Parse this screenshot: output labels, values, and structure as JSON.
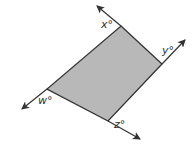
{
  "diagram": {
    "type": "parallelogram-with-extended-sides",
    "fill_color": "#b8b8b8",
    "line_color": "#333333",
    "vertices": {
      "top": [
        121,
        26
      ],
      "right": [
        162,
        64
      ],
      "bottom": [
        108,
        121
      ],
      "left": [
        47,
        89
      ]
    },
    "rays": [
      {
        "name": "ray-top",
        "from": [
          121,
          26
        ],
        "to": [
          97,
          6
        ]
      },
      {
        "name": "ray-right",
        "from": [
          162,
          64
        ],
        "to": [
          185,
          40
        ]
      },
      {
        "name": "ray-left",
        "from": [
          47,
          89
        ],
        "to": [
          22,
          109
        ]
      },
      {
        "name": "ray-bottom",
        "from": [
          108,
          121
        ],
        "to": [
          140,
          139
        ]
      }
    ],
    "labels": {
      "x": "x°",
      "y": "y°",
      "w": "w°",
      "z": "z°"
    }
  }
}
